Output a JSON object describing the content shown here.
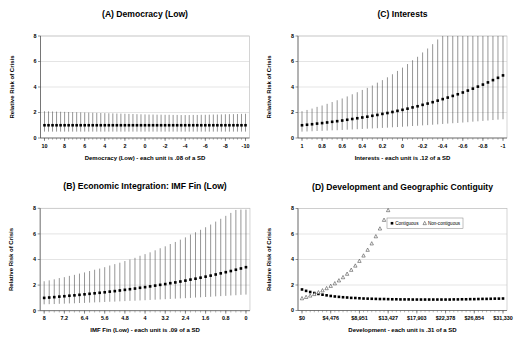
{
  "figure": {
    "background": "#ffffff",
    "grid_color": "#c9c9c9",
    "axis_color": "#4d4d4d",
    "border_color": "#aaaaaa",
    "errorbar_color": "#3f3f3f",
    "marker_color": "#000000"
  },
  "chart_data": [
    {
      "id": "a",
      "type": "scatter",
      "title": "(A) Democracy (Low)",
      "xlabel": "Democracy (Low) - each unit is .08 of a SD",
      "ylabel": "Relative Risk of Crisis",
      "ylim": [
        0,
        8
      ],
      "yticks": [
        0,
        2,
        4,
        6,
        8
      ],
      "xtick_labels": [
        "10",
        "8",
        "6",
        "4",
        "2",
        "0",
        "-2",
        "-4",
        "-6",
        "-8",
        "-10"
      ],
      "n": 51,
      "grid": true,
      "series": [
        {
          "marker": "filled-square",
          "y": [
            1.0,
            1.0,
            1.0,
            1.0,
            1.0,
            1.0,
            1.0,
            1.0,
            1.0,
            1.0,
            1.0,
            1.0,
            1.0,
            1.0,
            1.0,
            1.0,
            1.0,
            1.0,
            1.0,
            1.0,
            1.0,
            1.0,
            1.0,
            1.0,
            1.0,
            1.0,
            1.0,
            1.0,
            1.0,
            1.0,
            1.0,
            1.0,
            1.0,
            1.0,
            1.0,
            1.0,
            1.0,
            1.0,
            1.0,
            1.0,
            1.0,
            1.0,
            1.0,
            1.0,
            1.0,
            1.0,
            1.0,
            1.0,
            1.0,
            1.0,
            1.0
          ],
          "lo": [
            0.5,
            0.5,
            0.5,
            0.5,
            0.5,
            0.5,
            0.5,
            0.5,
            0.5,
            0.5,
            0.5,
            0.5,
            0.5,
            0.5,
            0.5,
            0.5,
            0.5,
            0.5,
            0.5,
            0.5,
            0.5,
            0.5,
            0.5,
            0.5,
            0.5,
            0.5,
            0.5,
            0.5,
            0.5,
            0.5,
            0.5,
            0.5,
            0.5,
            0.5,
            0.5,
            0.5,
            0.5,
            0.5,
            0.5,
            0.5,
            0.5,
            0.5,
            0.5,
            0.5,
            0.5,
            0.5,
            0.5,
            0.5,
            0.5,
            0.5,
            0.5
          ],
          "hi": [
            2.1,
            2.09,
            2.08,
            2.07,
            2.06,
            2.05,
            2.04,
            2.03,
            2.02,
            2.01,
            2.0,
            1.99,
            1.98,
            1.97,
            1.96,
            1.95,
            1.94,
            1.93,
            1.92,
            1.91,
            1.9,
            1.89,
            1.88,
            1.87,
            1.86,
            1.85,
            1.84,
            1.84,
            1.83,
            1.83,
            1.82,
            1.82,
            1.81,
            1.81,
            1.8,
            1.8,
            1.8,
            1.81,
            1.81,
            1.82,
            1.82,
            1.83,
            1.84,
            1.84,
            1.85,
            1.86,
            1.87,
            1.87,
            1.88,
            1.89,
            1.9
          ]
        }
      ]
    },
    {
      "id": "c",
      "type": "scatter",
      "title": "(C) Interests",
      "xlabel": "Interests - each unit is .12 of a SD",
      "ylabel": "Relative Risk of Crisis",
      "ylim": [
        0,
        8
      ],
      "yticks": [
        0,
        2,
        4,
        6,
        8
      ],
      "xtick_labels": [
        "1",
        "0.8",
        "0.6",
        "0.4",
        "0.2",
        "0",
        "-0.2",
        "-0.4",
        "-0.6",
        "-0.8",
        "-1"
      ],
      "n": 41,
      "grid": true,
      "series": [
        {
          "marker": "filled-square",
          "y": [
            1.0,
            1.04,
            1.08,
            1.13,
            1.17,
            1.22,
            1.27,
            1.32,
            1.37,
            1.43,
            1.49,
            1.55,
            1.61,
            1.67,
            1.74,
            1.81,
            1.89,
            1.96,
            2.04,
            2.13,
            2.21,
            2.3,
            2.4,
            2.49,
            2.6,
            2.7,
            2.81,
            2.93,
            3.05,
            3.17,
            3.3,
            3.43,
            3.57,
            3.72,
            3.87,
            4.03,
            4.19,
            4.36,
            4.54,
            4.72,
            4.91
          ],
          "lo": [
            0.5,
            0.51,
            0.53,
            0.55,
            0.56,
            0.58,
            0.6,
            0.61,
            0.63,
            0.65,
            0.67,
            0.69,
            0.71,
            0.73,
            0.75,
            0.77,
            0.79,
            0.81,
            0.84,
            0.86,
            0.88,
            0.91,
            0.94,
            0.96,
            0.99,
            1.01,
            1.04,
            1.07,
            1.1,
            1.13,
            1.16,
            1.18,
            1.21,
            1.24,
            1.28,
            1.31,
            1.34,
            1.37,
            1.41,
            1.44,
            1.47
          ],
          "hi": [
            2.1,
            2.2,
            2.31,
            2.44,
            2.55,
            2.68,
            2.82,
            2.96,
            3.1,
            3.26,
            3.43,
            3.59,
            3.77,
            3.93,
            4.12,
            4.34,
            4.54,
            4.76,
            5.0,
            5.26,
            5.52,
            5.8,
            6.1,
            6.37,
            6.71,
            7.02,
            7.36,
            7.73,
            8.0,
            8.0,
            8.0,
            8.0,
            8.0,
            8.0,
            8.0,
            8.0,
            8.0,
            8.0,
            8.0,
            8.0,
            8.0
          ]
        }
      ]
    },
    {
      "id": "b",
      "type": "scatter",
      "title": "(B) Economic Integration: IMF Fin (Low)",
      "xlabel": "IMF Fin (Low) - each unit is .09 of a SD",
      "ylabel": "Relative Risk of Crisis",
      "ylim": [
        0,
        8
      ],
      "yticks": [
        0,
        2,
        4,
        6,
        8
      ],
      "xtick_labels": [
        "8",
        "7.2",
        "6.4",
        "5.6",
        "4.8",
        "4",
        "3.2",
        "2.4",
        "1.6",
        "0.8",
        "0"
      ],
      "n": 41,
      "grid": true,
      "series": [
        {
          "marker": "filled-square",
          "y": [
            1.0,
            1.03,
            1.06,
            1.1,
            1.13,
            1.17,
            1.2,
            1.24,
            1.28,
            1.32,
            1.36,
            1.4,
            1.44,
            1.49,
            1.53,
            1.58,
            1.63,
            1.68,
            1.73,
            1.79,
            1.84,
            1.9,
            1.96,
            2.02,
            2.08,
            2.15,
            2.21,
            2.28,
            2.35,
            2.43,
            2.5,
            2.58,
            2.66,
            2.74,
            2.83,
            2.92,
            3.01,
            3.1,
            3.2,
            3.3,
            3.4
          ],
          "lo": [
            0.5,
            0.51,
            0.52,
            0.54,
            0.55,
            0.57,
            0.58,
            0.6,
            0.61,
            0.63,
            0.65,
            0.66,
            0.68,
            0.7,
            0.71,
            0.73,
            0.75,
            0.77,
            0.78,
            0.8,
            0.82,
            0.84,
            0.86,
            0.88,
            0.9,
            0.92,
            0.94,
            0.96,
            0.98,
            1.0,
            1.03,
            1.05,
            1.07,
            1.09,
            1.12,
            1.14,
            1.16,
            1.19,
            1.21,
            1.24,
            1.26
          ],
          "hi": [
            2.3,
            2.37,
            2.45,
            2.55,
            2.62,
            2.72,
            2.8,
            2.9,
            2.99,
            3.1,
            3.2,
            3.29,
            3.4,
            3.53,
            3.64,
            3.75,
            3.88,
            4.0,
            4.13,
            4.29,
            4.42,
            4.56,
            4.72,
            4.88,
            5.03,
            5.21,
            5.37,
            5.55,
            5.73,
            5.95,
            6.13,
            6.32,
            6.52,
            6.73,
            6.96,
            7.18,
            7.41,
            7.64,
            7.87,
            7.9,
            7.9
          ]
        }
      ]
    },
    {
      "id": "d",
      "type": "scatter",
      "title": "(D) Development and Geographic Contiguity",
      "xlabel": "Development - each unit is .31 of a SD",
      "ylabel": "Relative Risk of Crisis",
      "ylim": [
        0,
        8
      ],
      "yticks": [
        0,
        2,
        4,
        6,
        8
      ],
      "xtick_labels": [
        "$0",
        "$4,476",
        "$8,951",
        "$13,427",
        "$17,903",
        "$22,378",
        "$26,854",
        "$31,330"
      ],
      "n": 50,
      "grid": true,
      "legend": {
        "items": [
          {
            "symbol": "filled-square",
            "label": "Contiguous"
          },
          {
            "symbol": "open-triangle",
            "label": "Non-contiguous"
          }
        ]
      },
      "series": [
        {
          "name": "Contiguous",
          "marker": "filled-square",
          "y": [
            1.65,
            1.54,
            1.45,
            1.37,
            1.3,
            1.24,
            1.19,
            1.14,
            1.1,
            1.07,
            1.04,
            1.02,
            0.99,
            0.98,
            0.96,
            0.94,
            0.93,
            0.92,
            0.91,
            0.9,
            0.9,
            0.89,
            0.88,
            0.88,
            0.87,
            0.87,
            0.87,
            0.86,
            0.86,
            0.86,
            0.86,
            0.86,
            0.86,
            0.86,
            0.86,
            0.86,
            0.86,
            0.87,
            0.87,
            0.88,
            0.88,
            0.89,
            0.89,
            0.9,
            0.91,
            0.91,
            0.92,
            0.93,
            0.93,
            0.94
          ]
        },
        {
          "name": "Non-contiguous",
          "marker": "open-triangle",
          "y": [
            0.95,
            1.05,
            1.16,
            1.28,
            1.42,
            1.57,
            1.74,
            1.92,
            2.12,
            2.35,
            2.6,
            2.87,
            3.18,
            3.51,
            3.88,
            4.3,
            4.75,
            5.25,
            5.81,
            6.42,
            7.1,
            7.86
          ]
        }
      ]
    }
  ]
}
